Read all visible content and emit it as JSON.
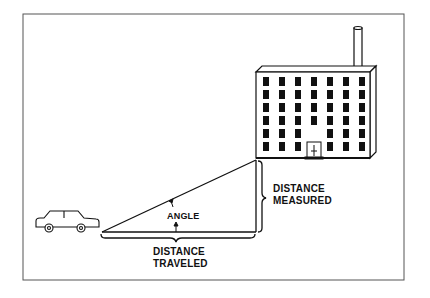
{
  "diagram": {
    "labels": {
      "angle": "ANGLE",
      "distance_measured_line1": "DISTANCE",
      "distance_measured_line2": "MEASURED",
      "distance_traveled_line1": "DISTANCE",
      "distance_traveled_line2": "TRAVELED"
    },
    "elements": [
      "car",
      "building",
      "triangle",
      "angle-arc"
    ],
    "colors": {
      "ink": "#111111",
      "background": "#ffffff",
      "frame": "#444444"
    }
  }
}
